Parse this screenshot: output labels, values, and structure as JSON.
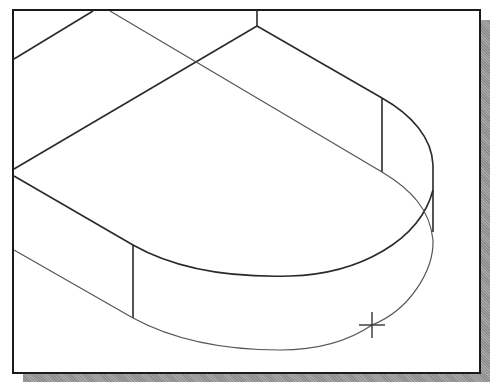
{
  "viewport": {
    "label": "drawing-viewport",
    "background": "#ffffff",
    "border_color": "#1a1a1a",
    "shadow_color": "#9a9a9a"
  },
  "drawing": {
    "type": "isometric-wireframe",
    "subject": "slot-shaped block with rounded end",
    "line_color": "#2a2a2a",
    "thin_line_color": "#555555"
  },
  "cursor": {
    "type": "crosshair",
    "x": 372,
    "y": 325
  }
}
